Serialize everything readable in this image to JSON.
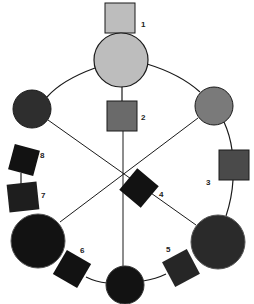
{
  "diagram": {
    "type": "ring-network",
    "colors": {
      "light": "#bdbdbd",
      "medium": "#7a7a7a",
      "mediumdark": "#5e5e5e",
      "dark": "#2e2e2e",
      "black": "#121212",
      "stroke": "#1a1a1a"
    },
    "labels": {
      "n1": "1",
      "n2": "2",
      "n3": "3",
      "n4": "4",
      "n5": "5",
      "n6": "6",
      "n7": "7",
      "n8": "8"
    },
    "nodes": [
      {
        "id": "square-1",
        "shape": "square",
        "label": "1",
        "shade": "light"
      },
      {
        "id": "circle-top",
        "shape": "circle",
        "size": "large",
        "shade": "light"
      },
      {
        "id": "square-2",
        "shape": "square",
        "label": "2",
        "shade": "medium"
      },
      {
        "id": "circle-left",
        "shape": "circle",
        "size": "medium",
        "shade": "dark"
      },
      {
        "id": "circle-right",
        "shape": "circle",
        "size": "medium",
        "shade": "medium"
      },
      {
        "id": "square-3",
        "shape": "square",
        "label": "3",
        "shade": "mediumdark"
      },
      {
        "id": "square-4",
        "shape": "square",
        "label": "4",
        "shade": "black"
      },
      {
        "id": "square-5",
        "shape": "square",
        "label": "5",
        "shade": "dark"
      },
      {
        "id": "square-6",
        "shape": "square",
        "label": "6",
        "shade": "black"
      },
      {
        "id": "square-7",
        "shape": "square",
        "label": "7",
        "shade": "black"
      },
      {
        "id": "square-8",
        "shape": "square",
        "label": "8",
        "shade": "black"
      },
      {
        "id": "circle-bottom-left",
        "shape": "circle",
        "size": "large",
        "shade": "black"
      },
      {
        "id": "circle-bottom",
        "shape": "circle",
        "size": "medium",
        "shade": "black"
      },
      {
        "id": "circle-bottom-right",
        "shape": "circle",
        "size": "large",
        "shade": "dark"
      }
    ]
  }
}
